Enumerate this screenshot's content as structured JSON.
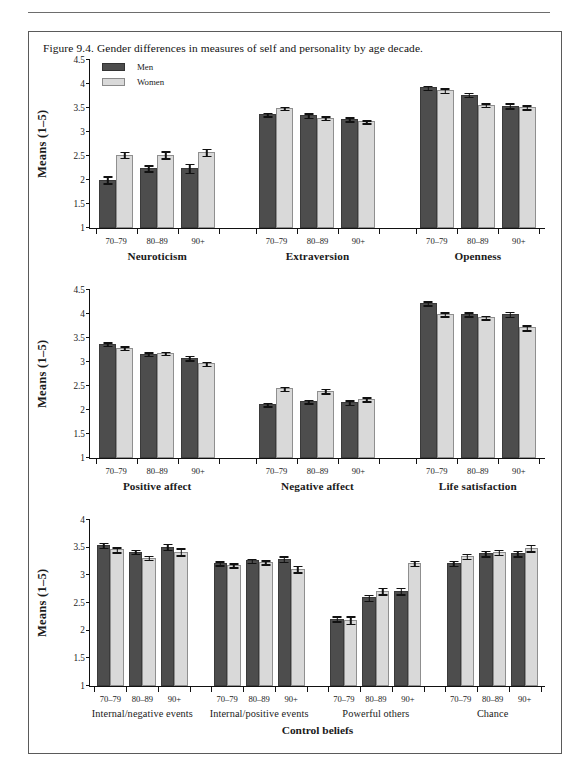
{
  "caption": "Figure 9.4. Gender differences in measures of self and personality by age decade.",
  "legend": {
    "men": "Men",
    "women": "Women"
  },
  "axis": {
    "y_label": "Means (1–5)"
  },
  "super_title": "Control beliefs",
  "categories": [
    "70–79",
    "80–89",
    "90+"
  ],
  "colors": {
    "men": "#4d4d4d",
    "women": "#d9d9d9",
    "axis": "#111111"
  },
  "chart_data": {
    "type": "bar",
    "title": "Figure 9.4. Gender differences in measures of self and personality by age decade.",
    "xlabel": "",
    "ylabel": "Means (1–5)",
    "categories": [
      "70–79",
      "80–89",
      "90+"
    ],
    "legend_entries": [
      "Men",
      "Women"
    ],
    "legend_position": "top-left of first panel",
    "grid": false,
    "error_bars": "standard error",
    "rows": [
      {
        "ylim": [
          1,
          4.5
        ],
        "yticks": [
          1,
          1.5,
          2,
          2.5,
          3,
          3.5,
          4,
          4.5
        ],
        "ytick_labels": [
          "1",
          "1.5",
          "2",
          "2.5",
          "3",
          "3.5",
          "4",
          "4.5"
        ],
        "ylabel": "Means (1–5)",
        "panels": [
          {
            "title": "Neuroticism",
            "series": [
              {
                "name": "Men",
                "values": [
                  2.01,
                  2.25,
                  2.25
                ],
                "errors": [
                  0.09,
                  0.08,
                  0.11
                ]
              },
              {
                "name": "Women",
                "values": [
                  2.53,
                  2.53,
                  2.58
                ],
                "errors": [
                  0.08,
                  0.09,
                  0.09
                ]
              }
            ]
          },
          {
            "title": "Extraversion",
            "series": [
              {
                "name": "Men",
                "values": [
                  3.37,
                  3.35,
                  3.27
                ],
                "errors": [
                  0.05,
                  0.06,
                  0.06
                ]
              },
              {
                "name": "Women",
                "values": [
                  3.5,
                  3.3,
                  3.22
                ],
                "errors": [
                  0.05,
                  0.05,
                  0.05
                ]
              }
            ]
          },
          {
            "title": "Openness",
            "series": [
              {
                "name": "Men",
                "values": [
                  3.93,
                  3.78,
                  3.55
                ],
                "errors": [
                  0.06,
                  0.06,
                  0.07
                ]
              },
              {
                "name": "Women",
                "values": [
                  3.87,
                  3.57,
                  3.52
                ],
                "errors": [
                  0.06,
                  0.05,
                  0.06
                ]
              }
            ]
          }
        ]
      },
      {
        "ylim": [
          1,
          4.5
        ],
        "yticks": [
          1,
          1.5,
          2,
          2.5,
          3,
          3.5,
          4,
          4.5
        ],
        "ytick_labels": [
          "1",
          "1.5",
          "2",
          "2.5",
          "3",
          "3.5",
          "4",
          "4.5"
        ],
        "ylabel": "Means (1–5)",
        "panels": [
          {
            "title": "Positive affect",
            "series": [
              {
                "name": "Men",
                "values": [
                  3.38,
                  3.17,
                  3.09
                ],
                "errors": [
                  0.05,
                  0.05,
                  0.06
                ]
              },
              {
                "name": "Women",
                "values": [
                  3.3,
                  3.19,
                  2.97
                ],
                "errors": [
                  0.05,
                  0.05,
                  0.06
                ]
              }
            ]
          },
          {
            "title": "Negative affect",
            "series": [
              {
                "name": "Men",
                "values": [
                  2.12,
                  2.18,
                  2.16
                ],
                "errors": [
                  0.05,
                  0.05,
                  0.06
                ]
              },
              {
                "name": "Women",
                "values": [
                  2.45,
                  2.4,
                  2.23
                ],
                "errors": [
                  0.06,
                  0.06,
                  0.06
                ]
              }
            ]
          },
          {
            "title": "Life satisfaction",
            "series": [
              {
                "name": "Men",
                "values": [
                  4.23,
                  4.0,
                  4.0
                ],
                "errors": [
                  0.06,
                  0.06,
                  0.07
                ]
              },
              {
                "name": "Women",
                "values": [
                  4.0,
                  3.93,
                  3.72
                ],
                "errors": [
                  0.06,
                  0.05,
                  0.07
                ]
              }
            ]
          }
        ]
      },
      {
        "ylim": [
          1,
          4
        ],
        "yticks": [
          1,
          1.5,
          2,
          2.5,
          3,
          3.5,
          4
        ],
        "ytick_labels": [
          "1",
          "1.5",
          "2",
          "2.5",
          "3",
          "3.5",
          "4"
        ],
        "ylabel": "Means (1–5)",
        "super_title": "Control beliefs",
        "panels": [
          {
            "title": "Internal/negative events",
            "series": [
              {
                "name": "Men",
                "values": [
                  3.55,
                  3.43,
                  3.52
                ],
                "errors": [
                  0.06,
                  0.05,
                  0.07
                ]
              },
              {
                "name": "Women",
                "values": [
                  3.47,
                  3.32,
                  3.43
                ],
                "errors": [
                  0.06,
                  0.05,
                  0.08
                ]
              }
            ]
          },
          {
            "title": "Internal/positive events",
            "series": [
              {
                "name": "Men",
                "values": [
                  3.22,
                  3.27,
                  3.3
                ],
                "errors": [
                  0.05,
                  0.05,
                  0.06
                ]
              },
              {
                "name": "Women",
                "values": [
                  3.19,
                  3.24,
                  3.12
                ],
                "errors": [
                  0.05,
                  0.05,
                  0.07
                ]
              }
            ]
          },
          {
            "title": "Powerful others",
            "series": [
              {
                "name": "Men",
                "values": [
                  2.22,
                  2.6,
                  2.72
                ],
                "errors": [
                  0.06,
                  0.07,
                  0.07
                ]
              },
              {
                "name": "Women",
                "values": [
                  2.2,
                  2.72,
                  3.22
                ],
                "errors": [
                  0.08,
                  0.07,
                  0.06
                ]
              }
            ]
          },
          {
            "title": "Chance",
            "series": [
              {
                "name": "Men",
                "values": [
                  3.22,
                  3.4,
                  3.4
                ],
                "errors": [
                  0.06,
                  0.06,
                  0.06
                ]
              },
              {
                "name": "Women",
                "values": [
                  3.35,
                  3.42,
                  3.5
                ],
                "errors": [
                  0.06,
                  0.06,
                  0.07
                ]
              }
            ]
          }
        ]
      }
    ]
  }
}
